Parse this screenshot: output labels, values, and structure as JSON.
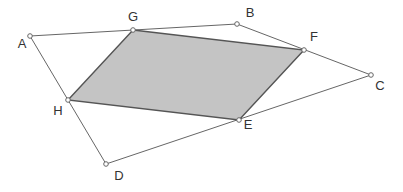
{
  "diagram": {
    "type": "geometry",
    "colors": {
      "stroke": "#666666",
      "inner_stroke": "#555555",
      "fill": "#c4c4c4",
      "point_fill": "#ffffff",
      "label": "#333333"
    },
    "points": {
      "A": {
        "label": "A",
        "x": 30,
        "y": 36,
        "lx": 22,
        "ly": 48
      },
      "G": {
        "label": "G",
        "x": 133,
        "y": 30,
        "lx": 133,
        "ly": 21
      },
      "B": {
        "label": "B",
        "x": 237,
        "y": 24,
        "lx": 250,
        "ly": 17
      },
      "F": {
        "label": "F",
        "x": 304,
        "y": 50,
        "lx": 314,
        "ly": 41
      },
      "C": {
        "label": "C",
        "x": 371,
        "y": 75,
        "lx": 380,
        "ly": 90
      },
      "E": {
        "label": "E",
        "x": 239,
        "y": 120,
        "lx": 248,
        "ly": 129
      },
      "D": {
        "label": "D",
        "x": 106,
        "y": 164,
        "lx": 119,
        "ly": 180
      },
      "H": {
        "label": "H",
        "x": 68,
        "y": 100,
        "lx": 58,
        "ly": 115
      }
    },
    "outer_polygon": [
      "A",
      "B",
      "C",
      "D"
    ],
    "inner_polygon": [
      "G",
      "F",
      "E",
      "H"
    ]
  }
}
